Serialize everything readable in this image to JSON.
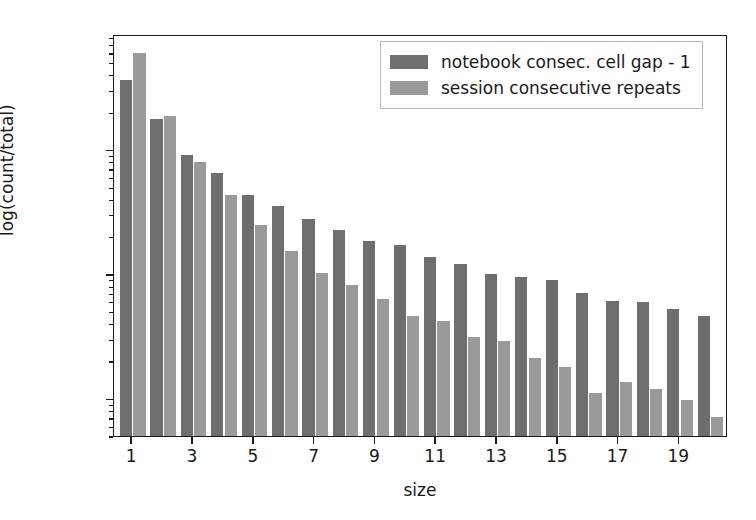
{
  "chart_data": {
    "type": "bar",
    "title": "",
    "xlabel": "size",
    "ylabel": "log(count/total)",
    "yscale": "log",
    "ylim": [
      0.0005,
      0.85
    ],
    "xlim": [
      0.4,
      20.6
    ],
    "grid": false,
    "legend_position": "upper right",
    "xtick_labels": [
      "1",
      "3",
      "5",
      "7",
      "9",
      "11",
      "13",
      "15",
      "17",
      "19"
    ],
    "xtick_values": [
      1,
      3,
      5,
      7,
      9,
      11,
      13,
      15,
      17,
      19
    ],
    "ytick_labels": [
      "10⁻¹",
      "10⁻²",
      "10⁻³"
    ],
    "ytick_values": [
      0.1,
      0.01,
      0.001
    ],
    "categories": [
      1,
      2,
      3,
      4,
      5,
      6,
      7,
      8,
      9,
      10,
      11,
      12,
      13,
      14,
      15,
      16,
      17,
      18,
      19,
      20
    ],
    "series": [
      {
        "name": "notebook consec. cell gap - 1",
        "color": "#6e6e6e",
        "values": [
          0.365,
          0.175,
          0.091,
          0.065,
          0.0435,
          0.0355,
          0.0275,
          0.0225,
          0.0185,
          0.017,
          0.0136,
          0.012,
          0.01,
          0.0094,
          0.0089,
          0.007,
          0.0061,
          0.006,
          0.0052,
          0.0046
        ]
      },
      {
        "name": "session consecutive repeats",
        "color": "#9a9a9a",
        "values": [
          0.6,
          0.185,
          0.079,
          0.0435,
          0.025,
          0.0152,
          0.0103,
          0.0082,
          0.0063,
          0.0046,
          0.0042,
          0.0031,
          0.0029,
          0.0021,
          0.0018,
          0.0011,
          0.00135,
          0.00119,
          0.00097,
          0.00071
        ]
      }
    ]
  },
  "axes": {
    "xlabel": "size",
    "ylabel": "log(count/total)"
  },
  "legend": {
    "entries": [
      {
        "label": "notebook consec. cell gap - 1",
        "color": "#6e6e6e"
      },
      {
        "label": "session consecutive repeats",
        "color": "#9a9a9a"
      }
    ]
  }
}
